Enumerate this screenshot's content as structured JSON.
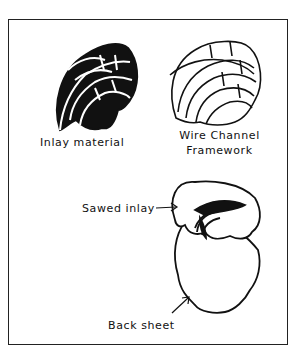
{
  "figure": {
    "labels": {
      "inlay_material": "Inlay material",
      "wire_channel_line1": "Wire  Channel",
      "wire_channel_line2": "Framework",
      "sawed_inlay": "Sawed inlay",
      "back_sheet": "Back sheet"
    },
    "colors": {
      "ink": "#111111",
      "background": "#ffffff"
    }
  }
}
